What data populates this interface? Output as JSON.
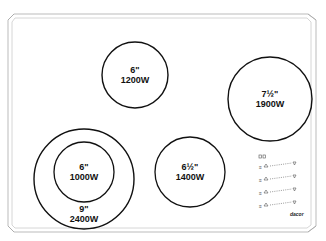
{
  "cooktop": {
    "frame": {
      "stroke": "#bbbbbb"
    },
    "burners": [
      {
        "id": "left-rear",
        "size": "6\"",
        "power": "1200W",
        "cx": 135,
        "cy": 75,
        "r": 33
      },
      {
        "id": "right-rear",
        "size": "7½\"",
        "power": "1900W",
        "cx": 270,
        "cy": 99,
        "r": 42
      },
      {
        "id": "left-front-inner",
        "size": "6\"",
        "power": "1000W",
        "cx": 84,
        "cy": 172,
        "r": 30
      },
      {
        "id": "left-front-outer",
        "size": "9\"",
        "power": "2400W",
        "cx": 84,
        "cy": 179,
        "r": 50
      },
      {
        "id": "right-front",
        "size": "6½\"",
        "power": "1400W",
        "cx": 190,
        "cy": 172,
        "r": 35
      }
    ],
    "controls": {
      "rows": 4,
      "top_glyph": "◫◫",
      "logo": "dacor"
    }
  }
}
